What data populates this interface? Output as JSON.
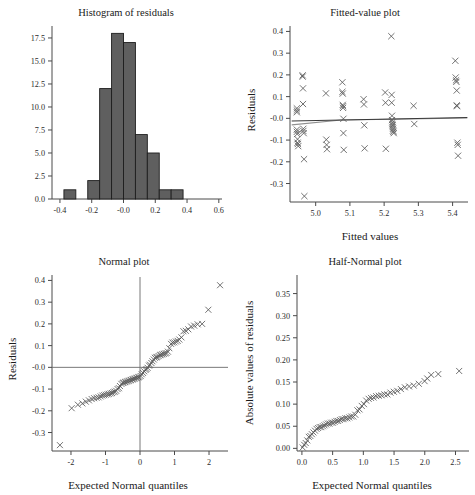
{
  "figure": {
    "name": "residual-diagnostics-panel",
    "layout": "2x2",
    "n": 64
  },
  "chart_data": [
    {
      "id": "histogram-of-residuals",
      "type": "bar",
      "title": "Histogram of residuals",
      "xlabel": "",
      "ylabel": "",
      "xlim": [
        -0.45,
        0.62
      ],
      "ylim": [
        0,
        18.8
      ],
      "grid": false,
      "legend": null,
      "xticks": [
        -0.4,
        -0.2,
        -0.0,
        0.2,
        0.4,
        0.6
      ],
      "xticklabels": [
        "-0.4",
        "-0.2",
        "-0.0",
        "0.2",
        "0.4",
        "0.6"
      ],
      "yticks": [
        0.0,
        2.5,
        5.0,
        7.5,
        10.0,
        12.5,
        15.0,
        17.5
      ],
      "yticklabels": [
        "0.0",
        "2.5",
        "5.0",
        "7.5",
        "10.0",
        "12.5",
        "15.0",
        "17.5"
      ],
      "bin_edges": [
        -0.375,
        -0.3,
        -0.225,
        -0.15,
        -0.075,
        0.0,
        0.075,
        0.15,
        0.225,
        0.3,
        0.375
      ],
      "bin_width": 0.075,
      "categories": [
        "-0.375..-0.300",
        "-0.300..-0.225",
        "-0.225..-0.150",
        "-0.150..-0.075",
        "-0.075..0.000",
        "0.000..0.075",
        "0.075..0.150",
        "0.150..0.225",
        "0.225..0.300",
        "0.300..0.375"
      ],
      "values": [
        1,
        0,
        2,
        12,
        18,
        17,
        7,
        5,
        1,
        1
      ],
      "total_count": 64
    },
    {
      "id": "fitted-value-plot",
      "type": "scatter",
      "title": "Fitted-value plot",
      "xlabel": "Fitted values",
      "ylabel": "Residuals",
      "xlim": [
        4.925,
        5.445
      ],
      "ylim": [
        -0.385,
        0.425
      ],
      "grid": false,
      "legend": null,
      "marker": "x",
      "xticks": [
        5.0,
        5.1,
        5.2,
        5.3,
        5.4
      ],
      "xticklabels": [
        "5.0",
        "5.1",
        "5.2",
        "5.3",
        "5.4"
      ],
      "yticks": [
        -0.3,
        -0.2,
        -0.1,
        -0.0,
        0.1,
        0.2,
        0.3,
        0.4
      ],
      "yticklabels": [
        "-0.3",
        "-0.2",
        "-0.1",
        "-0.0",
        "0.1",
        "0.2",
        "0.3",
        "0.4"
      ],
      "x": [
        4.945,
        4.945,
        4.945,
        4.945,
        4.945,
        4.946,
        4.947,
        4.947,
        4.948,
        4.949,
        4.962,
        4.962,
        4.963,
        4.963,
        4.964,
        4.964,
        4.965,
        4.966,
        4.967,
        5.03,
        5.031,
        5.032,
        5.033,
        5.078,
        5.078,
        5.079,
        5.079,
        5.08,
        5.08,
        5.081,
        5.081,
        5.082,
        5.14,
        5.141,
        5.142,
        5.143,
        5.203,
        5.204,
        5.205,
        5.221,
        5.222,
        5.222,
        5.223,
        5.223,
        5.224,
        5.224,
        5.225,
        5.225,
        5.226,
        5.226,
        5.227,
        5.228,
        5.286,
        5.288,
        5.408,
        5.409,
        5.41,
        5.411,
        5.412,
        5.412,
        5.413,
        5.414,
        5.415,
        5.416
      ],
      "y": [
        0.046,
        0.036,
        0.028,
        -0.052,
        -0.062,
        -0.072,
        -0.096,
        -0.112,
        -0.118,
        -0.128,
        0.198,
        0.192,
        0.138,
        0.066,
        -0.048,
        -0.058,
        -0.068,
        -0.188,
        -0.358,
        0.115,
        -0.098,
        -0.122,
        -0.142
      ],
      "y_full": [
        0.046,
        0.036,
        0.028,
        -0.052,
        -0.062,
        -0.072,
        -0.096,
        -0.112,
        -0.118,
        -0.128,
        0.198,
        0.192,
        0.138,
        0.066,
        -0.048,
        -0.058,
        -0.068,
        -0.188,
        -0.358,
        0.115,
        -0.098,
        -0.122,
        -0.142,
        0.166,
        0.122,
        0.114,
        0.062,
        0.056,
        0.048,
        -0.002,
        -0.068,
        -0.145,
        0.088,
        0.064,
        -0.032,
        -0.138,
        0.119,
        0.072,
        -0.14,
        0.378,
        0.108,
        0.072,
        0.012,
        -0.008,
        -0.018,
        -0.026,
        -0.032,
        -0.04,
        -0.048,
        -0.056,
        -0.062,
        -0.068,
        0.058,
        -0.026,
        0.265,
        0.188,
        0.175,
        0.168,
        0.128,
        0.06,
        0.056,
        -0.112,
        -0.122,
        -0.172
      ],
      "fit_line": {
        "name": "least-squares fit",
        "x": [
          4.93,
          5.443
        ],
        "y": [
          -0.012,
          0.004
        ],
        "color": "#3a3a3a"
      },
      "smooth_line": {
        "name": "lowess smoother",
        "x": [
          4.93,
          5.075,
          5.23,
          5.443
        ],
        "y": [
          -0.03,
          -0.008,
          -0.004,
          0.002
        ],
        "color": "#8f8f8f"
      }
    },
    {
      "id": "normal-plot",
      "type": "scatter",
      "title": "Normal plot",
      "xlabel": "Expected Normal quantiles",
      "ylabel": "Residuals",
      "xlim": [
        -2.55,
        2.55
      ],
      "ylim": [
        -0.385,
        0.425
      ],
      "grid": false,
      "legend": null,
      "marker": "x",
      "reference_lines": {
        "vertical_x": 0,
        "horizontal_y": 0
      },
      "xticks": [
        -2,
        -1,
        0,
        1,
        2
      ],
      "xticklabels": [
        "-2",
        "-1",
        "0",
        "1",
        "2"
      ],
      "yticks": [
        -0.3,
        -0.2,
        -0.1,
        -0.0,
        0.1,
        0.2,
        0.3,
        0.4
      ],
      "yticklabels": [
        "-0.3",
        "-0.2",
        "-0.1",
        "-0.0",
        "0.1",
        "0.2",
        "0.3",
        "0.4"
      ],
      "x": [
        -2.32,
        -1.98,
        -1.8,
        -1.67,
        -1.57,
        -1.48,
        -1.4,
        -1.33,
        -1.26,
        -1.2,
        -1.14,
        -1.09,
        -1.04,
        -0.99,
        -0.94,
        -0.9,
        -0.85,
        -0.81,
        -0.77,
        -0.73,
        -0.69,
        -0.65,
        -0.61,
        -0.58,
        -0.54,
        -0.5,
        -0.47,
        -0.43,
        -0.4,
        -0.36,
        -0.33,
        -0.29,
        -0.26,
        -0.22,
        -0.19,
        -0.16,
        -0.12,
        -0.09,
        -0.05,
        -0.02,
        0.02,
        0.05,
        0.09,
        0.12,
        0.16,
        0.19,
        0.22,
        0.26,
        0.29,
        0.33,
        0.36,
        0.4,
        0.43,
        0.47,
        0.5,
        0.54,
        0.58,
        0.61,
        0.65,
        0.69,
        0.73,
        0.77,
        0.81,
        0.85,
        0.9,
        0.94,
        0.99,
        1.04,
        1.09,
        1.14,
        1.2,
        1.26,
        1.33,
        1.4,
        1.48,
        1.57,
        1.67,
        1.8,
        1.98,
        2.32
      ],
      "y": [
        -0.358,
        -0.188,
        -0.172,
        -0.166,
        -0.158,
        -0.152,
        -0.146,
        -0.142,
        -0.14,
        -0.138,
        -0.134,
        -0.13,
        -0.128,
        -0.126,
        -0.124,
        -0.122,
        -0.12,
        -0.118,
        -0.114,
        -0.112,
        -0.108,
        -0.1,
        -0.096,
        -0.086,
        -0.076,
        -0.072,
        -0.07,
        -0.068,
        -0.066,
        -0.064,
        -0.062,
        -0.06,
        -0.058,
        -0.056,
        -0.054,
        -0.052,
        -0.05,
        -0.048,
        -0.046,
        -0.044,
        -0.04,
        -0.032,
        -0.026,
        -0.018,
        -0.012,
        -0.008,
        -0.002,
        0.008,
        0.012,
        0.02,
        0.028,
        0.036,
        0.044,
        0.046,
        0.048,
        0.052,
        0.056,
        0.058,
        0.06,
        0.062,
        0.064,
        0.066,
        0.072,
        0.088,
        0.108,
        0.114,
        0.115,
        0.119,
        0.122,
        0.128,
        0.138,
        0.166,
        0.168,
        0.175,
        0.188,
        0.192,
        0.198,
        0.2,
        0.265,
        0.378
      ]
    },
    {
      "id": "half-normal-plot",
      "type": "scatter",
      "title": "Half-Normal plot",
      "xlabel": "Expected Normal quantiles",
      "ylabel": "Absolute values of residuals",
      "xlim": [
        -0.08,
        2.72
      ],
      "ylim": [
        -0.006,
        0.392
      ],
      "grid": false,
      "legend": null,
      "marker": "x",
      "xticks": [
        0.0,
        0.5,
        1.0,
        1.5,
        2.0,
        2.5
      ],
      "xticklabels": [
        "0.0",
        "0.5",
        "1.0",
        "1.5",
        "2.0",
        "2.5"
      ],
      "yticks": [
        0.0,
        0.05,
        0.1,
        0.15,
        0.2,
        0.25,
        0.3,
        0.35
      ],
      "yticklabels": [
        "0.00",
        "0.05",
        "0.10",
        "0.15",
        "0.20",
        "0.25",
        "0.30",
        "0.35"
      ],
      "x": [
        0.012,
        0.037,
        0.062,
        0.087,
        0.112,
        0.137,
        0.162,
        0.187,
        0.213,
        0.238,
        0.264,
        0.29,
        0.316,
        0.342,
        0.368,
        0.395,
        0.422,
        0.449,
        0.476,
        0.504,
        0.532,
        0.56,
        0.589,
        0.618,
        0.648,
        0.678,
        0.708,
        0.739,
        0.771,
        0.803,
        0.836,
        0.869,
        0.903,
        0.938,
        0.974,
        1.01,
        1.047,
        1.086,
        1.125,
        1.166,
        1.208,
        1.251,
        1.296,
        1.343,
        1.391,
        1.442,
        1.496,
        1.552,
        1.612,
        1.676,
        1.745,
        1.82,
        1.903,
        1.997,
        2.04,
        2.105,
        2.22,
        2.56
      ],
      "y": [
        0.002,
        0.008,
        0.012,
        0.018,
        0.026,
        0.028,
        0.032,
        0.036,
        0.04,
        0.044,
        0.046,
        0.048,
        0.048,
        0.05,
        0.052,
        0.054,
        0.056,
        0.056,
        0.058,
        0.058,
        0.06,
        0.062,
        0.062,
        0.064,
        0.066,
        0.066,
        0.068,
        0.068,
        0.07,
        0.072,
        0.072,
        0.076,
        0.086,
        0.088,
        0.096,
        0.1,
        0.108,
        0.112,
        0.114,
        0.115,
        0.118,
        0.119,
        0.12,
        0.122,
        0.122,
        0.126,
        0.128,
        0.13,
        0.134,
        0.138,
        0.14,
        0.142,
        0.146,
        0.152,
        0.158,
        0.166,
        0.168,
        0.175,
        0.188,
        0.192,
        0.198,
        0.2,
        0.265,
        0.362,
        0.378
      ]
    }
  ]
}
